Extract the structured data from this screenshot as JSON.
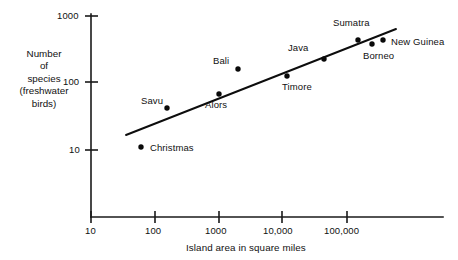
{
  "chart_data": {
    "type": "scatter",
    "title": "",
    "xlabel": "Island area in square miles",
    "ylabel": "Number of species (freshwater birds)",
    "ylabel_lines": [
      "Number",
      "of",
      "species",
      "(freshwater",
      "birds)"
    ],
    "xscale": "log",
    "yscale": "log",
    "xlim": [
      10,
      1000000
    ],
    "ylim": [
      5,
      1500
    ],
    "grid": false,
    "legend": null,
    "x_ticks": [
      {
        "value": 10,
        "label": "10"
      },
      {
        "value": 100,
        "label": "100"
      },
      {
        "value": 1000,
        "label": "1000"
      },
      {
        "value": 10000,
        "label": "10,000"
      },
      {
        "value": 100000,
        "label": "100,000"
      }
    ],
    "y_ticks": [
      {
        "value": 10,
        "label": "10"
      },
      {
        "value": 100,
        "label": "100"
      },
      {
        "value": 1000,
        "label": "1000"
      }
    ],
    "points": [
      {
        "name": "Christmas",
        "area": 62,
        "species": 11,
        "px": 141,
        "py": 147,
        "lx": 150,
        "ly": 142,
        "anchor": "left"
      },
      {
        "name": "Savu",
        "area": 240,
        "species": 40,
        "px": 167,
        "py": 108,
        "lx": 141,
        "ly": 95,
        "anchor": "left"
      },
      {
        "name": "Alors",
        "area": 1000,
        "species": 68,
        "px": 219,
        "py": 94,
        "lx": 205,
        "ly": 99,
        "anchor": "left"
      },
      {
        "name": "Bali",
        "area": 2050,
        "species": 150,
        "px": 238,
        "py": 69,
        "lx": 213,
        "ly": 55,
        "anchor": "left"
      },
      {
        "name": "Timore",
        "area": 11500,
        "species": 125,
        "px": 287,
        "py": 76,
        "lx": 282,
        "ly": 81,
        "anchor": "left"
      },
      {
        "name": "Java",
        "area": 48000,
        "species": 220,
        "px": 324,
        "py": 59,
        "lx": 288,
        "ly": 42,
        "anchor": "left"
      },
      {
        "name": "Sumatra",
        "area": 163000,
        "species": 380,
        "px": 358,
        "py": 40,
        "lx": 333,
        "ly": 17,
        "anchor": "left"
      },
      {
        "name": "Borneo",
        "area": 260000,
        "species": 330,
        "px": 372,
        "py": 44,
        "lx": 363,
        "ly": 50,
        "anchor": "left"
      },
      {
        "name": "New Guinea",
        "area": 306000,
        "species": 380,
        "px": 383,
        "py": 40,
        "lx": 391,
        "ly": 36,
        "anchor": "left"
      }
    ],
    "trend_line": {
      "x1": 126,
      "y1": 135,
      "x2": 396,
      "y2": 29,
      "description": "fitted straight line on log-log axes"
    },
    "axes_geometry": {
      "x_axis_y": 217,
      "y_axis_x": 91,
      "x_tick_px": [
        91,
        155,
        219,
        282,
        347
      ],
      "y_tick_px": [
        150,
        82,
        16
      ],
      "x_axis_x_end": 443,
      "y_axis_y_top": 14
    },
    "colors": {
      "ink": "#111111",
      "dot": "#0a0a0a",
      "background": "#ffffff"
    }
  }
}
